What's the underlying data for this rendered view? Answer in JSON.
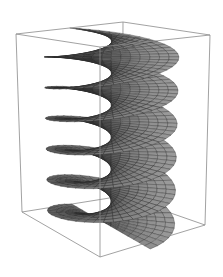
{
  "figure": {
    "surface": {
      "name": "helicoid",
      "parametrization": {
        "x": "v*cos(u)",
        "y": "v*sin(u)",
        "z": "u"
      },
      "u_range": [
        -9.42,
        9.42
      ],
      "v_range": [
        -1,
        1
      ],
      "mesh_u": 60,
      "mesh_v": 14
    },
    "colors": {
      "background": "#ffffff",
      "box": "#8a8a8a",
      "surface_light": "#a8a8a8",
      "surface_dark": "#3a3a3a",
      "mesh": "#2a2a2a"
    },
    "box_shown": true,
    "axes_labels_shown": false
  }
}
